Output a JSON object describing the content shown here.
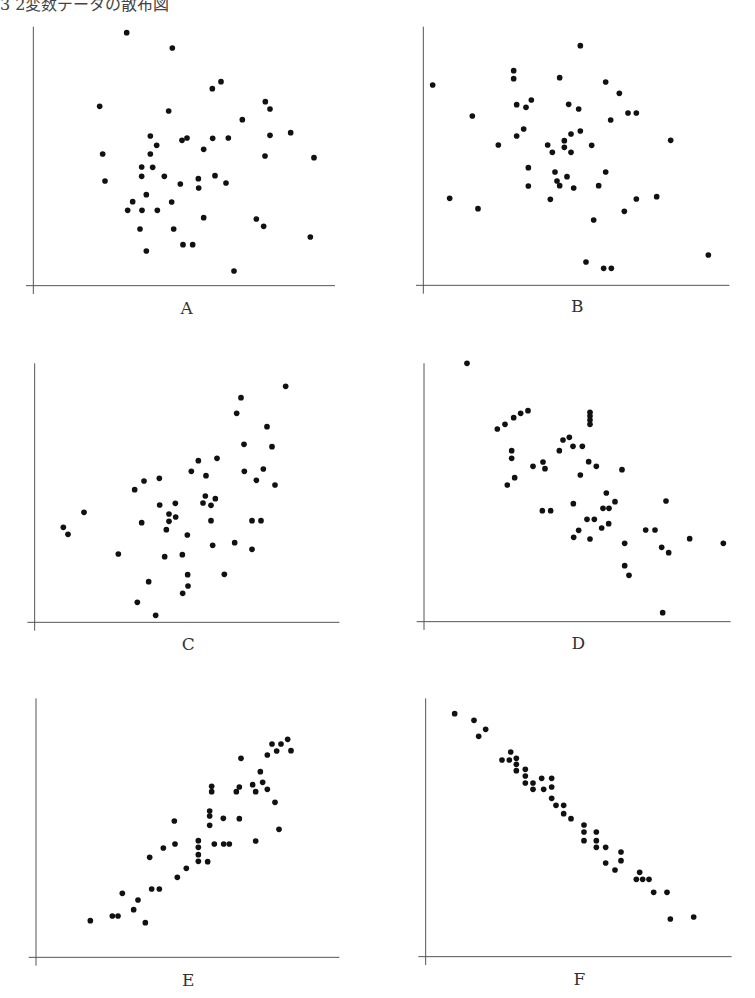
{
  "title": "3 2変数データの散布図",
  "chart_data": [
    {
      "type": "scatter",
      "label": "A",
      "title": "A",
      "xlabel": "",
      "ylabel": "",
      "grid": false,
      "correlation": "none",
      "origin": [
        20,
        20
      ],
      "crop": [
        320,
        300
      ],
      "axis": {
        "x0": 40,
        "y0": 797,
        "x1": 945,
        "ytop": 20
      },
      "label_pos": [
        500,
        870
      ],
      "points": [
        [
          320,
          38
        ],
        [
          457,
          84
        ],
        [
          577,
          206
        ],
        [
          603,
          185
        ],
        [
          239,
          259
        ],
        [
          446,
          273
        ],
        [
          667,
          299
        ],
        [
          736,
          245
        ],
        [
          750,
          267
        ],
        [
          812,
          338
        ],
        [
          750,
          346
        ],
        [
          391,
          348
        ],
        [
          486,
          361
        ],
        [
          501,
          354
        ],
        [
          578,
          355
        ],
        [
          625,
          354
        ],
        [
          410,
          376
        ],
        [
          551,
          388
        ],
        [
          248,
          402
        ],
        [
          391,
          402
        ],
        [
          735,
          408
        ],
        [
          882,
          413
        ],
        [
          365,
          441
        ],
        [
          398,
          442
        ],
        [
          365,
          469
        ],
        [
          433,
          469
        ],
        [
          535,
          476
        ],
        [
          585,
          467
        ],
        [
          255,
          483
        ],
        [
          481,
          492
        ],
        [
          618,
          489
        ],
        [
          536,
          504
        ],
        [
          379,
          524
        ],
        [
          338,
          545
        ],
        [
          455,
          546
        ],
        [
          323,
          571
        ],
        [
          366,
          571
        ],
        [
          412,
          571
        ],
        [
          551,
          593
        ],
        [
          709,
          597
        ],
        [
          731,
          619
        ],
        [
          360,
          627
        ],
        [
          461,
          627
        ],
        [
          871,
          651
        ],
        [
          379,
          693
        ],
        [
          489,
          674
        ],
        [
          518,
          674
        ],
        [
          642,
          753
        ]
      ]
    },
    {
      "type": "scatter",
      "label": "B",
      "title": "B",
      "xlabel": "",
      "ylabel": "",
      "grid": false,
      "correlation": "none / weak",
      "origin": [
        410,
        20
      ],
      "crop": [
        340,
        300
      ],
      "axis": {
        "x0": 40,
        "y0": 796,
        "x1": 958,
        "ytop": 20
      },
      "label_pos": [
        502,
        865
      ],
      "points": [
        [
          511,
          77
        ],
        [
          68,
          195
        ],
        [
          311,
          152
        ],
        [
          311,
          176
        ],
        [
          449,
          173
        ],
        [
          587,
          186
        ],
        [
          628,
          220
        ],
        [
          320,
          254
        ],
        [
          348,
          262
        ],
        [
          364,
          240
        ],
        [
          476,
          253
        ],
        [
          506,
          267
        ],
        [
          654,
          279
        ],
        [
          679,
          279
        ],
        [
          187,
          288
        ],
        [
          602,
          300
        ],
        [
          341,
          327
        ],
        [
          320,
          348
        ],
        [
          483,
          342
        ],
        [
          511,
          333
        ],
        [
          463,
          362
        ],
        [
          782,
          361
        ],
        [
          265,
          375
        ],
        [
          413,
          375
        ],
        [
          427,
          397
        ],
        [
          463,
          382
        ],
        [
          483,
          397
        ],
        [
          545,
          376
        ],
        [
          355,
          443
        ],
        [
          435,
          456
        ],
        [
          587,
          456
        ],
        [
          471,
          470
        ],
        [
          441,
          483
        ],
        [
          449,
          497
        ],
        [
          355,
          498
        ],
        [
          491,
          504
        ],
        [
          566,
          497
        ],
        [
          119,
          535
        ],
        [
          421,
          538
        ],
        [
          679,
          537
        ],
        [
          740,
          530
        ],
        [
          204,
          566
        ],
        [
          643,
          574
        ],
        [
          551,
          600
        ],
        [
          528,
          726
        ],
        [
          581,
          745
        ],
        [
          604,
          745
        ],
        [
          895,
          705
        ]
      ]
    },
    {
      "type": "scatter",
      "label": "C",
      "title": "C",
      "xlabel": "",
      "ylabel": "",
      "grid": false,
      "correlation": "positive (moderate)",
      "origin": [
        20,
        350
      ],
      "crop": [
        320,
        310
      ],
      "axis": {
        "x0": 44,
        "y0": 817,
        "x1": 958,
        "ytop": 40
      },
      "label_pos": [
        505,
        888
      ],
      "points": [
        [
          797,
          109
        ],
        [
          663,
          143
        ],
        [
          650,
          190
        ],
        [
          741,
          230
        ],
        [
          672,
          283
        ],
        [
          756,
          290
        ],
        [
          591,
          325
        ],
        [
          535,
          332
        ],
        [
          514,
          364
        ],
        [
          558,
          377
        ],
        [
          673,
          364
        ],
        [
          730,
          357
        ],
        [
          709,
          391
        ],
        [
          765,
          405
        ],
        [
          372,
          393
        ],
        [
          418,
          385
        ],
        [
          344,
          419
        ],
        [
          556,
          438
        ],
        [
          586,
          446
        ],
        [
          549,
          459
        ],
        [
          573,
          466
        ],
        [
          419,
          465
        ],
        [
          466,
          460
        ],
        [
          192,
          487
        ],
        [
          447,
          492
        ],
        [
          467,
          501
        ],
        [
          447,
          514
        ],
        [
          573,
          512
        ],
        [
          696,
          512
        ],
        [
          723,
          512
        ],
        [
          365,
          518
        ],
        [
          130,
          532
        ],
        [
          144,
          553
        ],
        [
          439,
          539
        ],
        [
          502,
          555
        ],
        [
          578,
          586
        ],
        [
          644,
          578
        ],
        [
          696,
          598
        ],
        [
          295,
          612
        ],
        [
          434,
          620
        ],
        [
          487,
          614
        ],
        [
          503,
          674
        ],
        [
          613,
          673
        ],
        [
          386,
          695
        ],
        [
          504,
          708
        ],
        [
          488,
          730
        ],
        [
          352,
          757
        ],
        [
          407,
          796
        ]
      ]
    },
    {
      "type": "scatter",
      "label": "D",
      "title": "D",
      "xlabel": "",
      "ylabel": "",
      "grid": false,
      "correlation": "negative (moderate)",
      "origin": [
        410,
        350
      ],
      "crop": [
        345,
        310
      ],
      "axis": {
        "x0": 42,
        "y0": 815,
        "x1": 962,
        "ytop": 40
      },
      "label_pos": [
        505,
        885
      ],
      "points": [
        [
          171,
          40
        ],
        [
          262,
          237
        ],
        [
          285,
          223
        ],
        [
          311,
          203
        ],
        [
          332,
          190
        ],
        [
          354,
          182
        ],
        [
          540,
          187
        ],
        [
          540,
          198
        ],
        [
          540,
          210
        ],
        [
          540,
          223
        ],
        [
          459,
          270
        ],
        [
          478,
          262
        ],
        [
          448,
          302
        ],
        [
          489,
          289
        ],
        [
          517,
          289
        ],
        [
          305,
          302
        ],
        [
          305,
          325
        ],
        [
          536,
          335
        ],
        [
          559,
          349
        ],
        [
          369,
          349
        ],
        [
          399,
          336
        ],
        [
          405,
          356
        ],
        [
          636,
          359
        ],
        [
          314,
          383
        ],
        [
          292,
          405
        ],
        [
          511,
          375
        ],
        [
          589,
          429
        ],
        [
          490,
          461
        ],
        [
          615,
          455
        ],
        [
          768,
          453
        ],
        [
          579,
          475
        ],
        [
          597,
          475
        ],
        [
          397,
          482
        ],
        [
          422,
          482
        ],
        [
          531,
          508
        ],
        [
          553,
          508
        ],
        [
          596,
          521
        ],
        [
          575,
          534
        ],
        [
          506,
          541
        ],
        [
          491,
          562
        ],
        [
          540,
          567
        ],
        [
          707,
          540
        ],
        [
          735,
          540
        ],
        [
          839,
          566
        ],
        [
          644,
          580
        ],
        [
          940,
          580
        ],
        [
          755,
          592
        ],
        [
          776,
          608
        ],
        [
          644,
          647
        ],
        [
          657,
          676
        ],
        [
          758,
          788
        ]
      ]
    },
    {
      "type": "scatter",
      "label": "E",
      "title": "E",
      "xlabel": "",
      "ylabel": "",
      "grid": false,
      "correlation": "positive (strong)",
      "origin": [
        20,
        690
      ],
      "crop": [
        320,
        308
      ],
      "axis": {
        "x0": 48,
        "y0": 802,
        "x1": 958,
        "ytop": 25
      },
      "label_pos": [
        505,
        875
      ],
      "points": [
        [
          803,
          148
        ],
        [
          756,
          162
        ],
        [
          783,
          162
        ],
        [
          770,
          183
        ],
        [
          813,
          182
        ],
        [
          742,
          195
        ],
        [
          663,
          205
        ],
        [
          721,
          245
        ],
        [
          698,
          284
        ],
        [
          728,
          277
        ],
        [
          742,
          298
        ],
        [
          707,
          305
        ],
        [
          575,
          289
        ],
        [
          575,
          305
        ],
        [
          658,
          291
        ],
        [
          649,
          305
        ],
        [
          765,
          337
        ],
        [
          569,
          363
        ],
        [
          569,
          378
        ],
        [
          610,
          385
        ],
        [
          658,
          386
        ],
        [
          463,
          393
        ],
        [
          569,
          406
        ],
        [
          777,
          418
        ],
        [
          535,
          452
        ],
        [
          707,
          453
        ],
        [
          535,
          472
        ],
        [
          465,
          462
        ],
        [
          583,
          462
        ],
        [
          611,
          462
        ],
        [
          628,
          462
        ],
        [
          430,
          474
        ],
        [
          535,
          494
        ],
        [
          389,
          502
        ],
        [
          535,
          514
        ],
        [
          563,
          515
        ],
        [
          499,
          535
        ],
        [
          472,
          562
        ],
        [
          395,
          597
        ],
        [
          418,
          597
        ],
        [
          307,
          610
        ],
        [
          354,
          630
        ],
        [
          341,
          659
        ],
        [
          277,
          678
        ],
        [
          294,
          678
        ],
        [
          211,
          692
        ],
        [
          376,
          698
        ]
      ]
    },
    {
      "type": "scatter",
      "label": "F",
      "title": "F",
      "xlabel": "",
      "ylabel": "",
      "grid": false,
      "correlation": "negative (strong)",
      "origin": [
        410,
        690
      ],
      "crop": [
        345,
        308
      ],
      "axis": {
        "x0": 47,
        "y0": 800,
        "x1": 965,
        "ytop": 25
      },
      "label_pos": [
        508,
        872
      ],
      "points": [
        [
          134,
          71
        ],
        [
          192,
          91
        ],
        [
          227,
          118
        ],
        [
          206,
          139
        ],
        [
          302,
          186
        ],
        [
          276,
          210
        ],
        [
          298,
          210
        ],
        [
          319,
          205
        ],
        [
          319,
          223
        ],
        [
          319,
          242
        ],
        [
          346,
          238
        ],
        [
          346,
          258
        ],
        [
          346,
          279
        ],
        [
          369,
          279
        ],
        [
          369,
          298
        ],
        [
          395,
          265
        ],
        [
          401,
          298
        ],
        [
          425,
          265
        ],
        [
          425,
          291
        ],
        [
          425,
          325
        ],
        [
          438,
          346
        ],
        [
          461,
          346
        ],
        [
          461,
          371
        ],
        [
          483,
          386
        ],
        [
          522,
          405
        ],
        [
          522,
          426
        ],
        [
          522,
          452
        ],
        [
          559,
          426
        ],
        [
          559,
          452
        ],
        [
          559,
          472
        ],
        [
          587,
          472
        ],
        [
          587,
          519
        ],
        [
          615,
          540
        ],
        [
          633,
          486
        ],
        [
          633,
          512
        ],
        [
          689,
          547
        ],
        [
          679,
          568
        ],
        [
          698,
          568
        ],
        [
          717,
          568
        ],
        [
          731,
          607
        ],
        [
          771,
          607
        ],
        [
          781,
          687
        ],
        [
          851,
          681
        ]
      ]
    }
  ]
}
